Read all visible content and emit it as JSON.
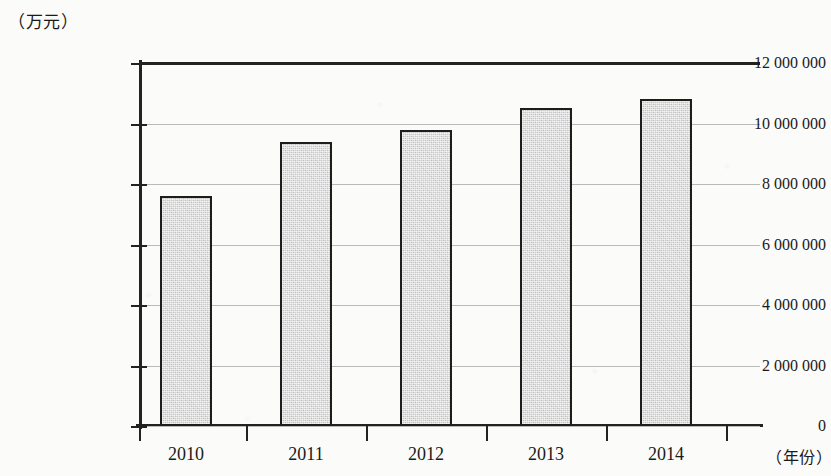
{
  "chart_data": {
    "type": "bar",
    "title": "",
    "subtitle": "",
    "xlabel": "（年份）",
    "ylabel": "（万元）",
    "categories": [
      "2010",
      "2011",
      "2012",
      "2013",
      "2014"
    ],
    "values": [
      7600000,
      9400000,
      9800000,
      10500000,
      10800000
    ],
    "series": [
      {
        "name": "",
        "values": [
          7600000,
          9400000,
          9800000,
          10500000,
          10800000
        ]
      }
    ],
    "ylim": [
      0,
      12000000
    ],
    "ytick_values": [
      0,
      2000000,
      4000000,
      6000000,
      8000000,
      10000000,
      12000000
    ],
    "ytick_labels": [
      "0",
      "2 000 000",
      "4 000 000",
      "6 000 000",
      "8 000 000",
      "10 000 000",
      "12 000 000"
    ],
    "grid": true,
    "legend": "none",
    "bar_fill_color": "#cbcbcb",
    "bar_border_color": "#1e1d1b",
    "axis_color": "#23221f",
    "gridline_color": "#b9b9b9",
    "background_color": "#fbfbfa"
  }
}
